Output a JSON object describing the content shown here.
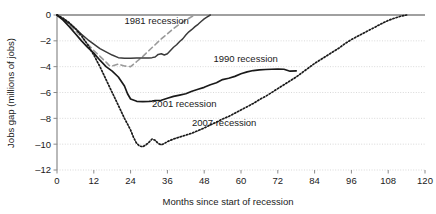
{
  "chart_data": {
    "type": "line",
    "title": "",
    "xlabel": "Months since start of recession",
    "ylabel": "Jobs gap (millions of jobs)",
    "xlim": [
      0,
      120
    ],
    "ylim": [
      -12,
      0
    ],
    "xticks": [
      0,
      12,
      24,
      36,
      48,
      60,
      72,
      84,
      96,
      108,
      120
    ],
    "xtick_labels": [
      "0",
      "12",
      "24",
      "36",
      "48",
      "60",
      "72",
      "84",
      "96",
      "108",
      "120"
    ],
    "yticks": [
      0,
      -2,
      -4,
      -6,
      -8,
      -10,
      -12
    ],
    "ytick_labels": [
      "0",
      "–2",
      "–4",
      "–6",
      "–8",
      "–10",
      "–12"
    ],
    "grid": true,
    "grid_axis": "y",
    "legend_position": "inline-annotations",
    "series": [
      {
        "name": "1981 recession",
        "label": "1981 recession",
        "color": "#9a9a9a",
        "style": "dashed",
        "width": 1.6,
        "label_x": 22,
        "label_y": -0.72,
        "x": [
          0,
          2,
          4,
          6,
          8,
          10,
          12,
          14,
          16,
          17,
          18,
          20,
          22,
          24,
          26,
          28,
          30,
          32,
          34,
          36,
          38,
          40,
          42,
          44,
          45
        ],
        "y": [
          0,
          -0.35,
          -0.75,
          -1.2,
          -1.7,
          -2.25,
          -2.75,
          -3.2,
          -3.65,
          -3.9,
          -3.95,
          -3.8,
          -3.95,
          -4.0,
          -3.6,
          -3.2,
          -2.75,
          -2.3,
          -1.85,
          -1.45,
          -1.05,
          -0.7,
          -0.4,
          -0.12,
          0
        ]
      },
      {
        "name": "1990 recession",
        "label": "1990 recession",
        "color": "#3a3a3a",
        "style": "solid",
        "width": 1.5,
        "label_x": 51,
        "label_y": -3.62,
        "x": [
          0,
          2,
          4,
          6,
          8,
          10,
          12,
          14,
          16,
          18,
          20,
          22,
          24,
          26,
          28,
          30,
          31,
          32,
          33,
          34,
          35,
          36,
          37,
          38,
          39,
          40,
          41,
          42,
          43,
          44,
          45,
          46,
          47,
          48,
          49,
          50
        ],
        "y": [
          0,
          -0.3,
          -0.65,
          -1.05,
          -1.5,
          -1.9,
          -2.25,
          -2.6,
          -2.85,
          -3.1,
          -3.3,
          -3.35,
          -3.34,
          -3.33,
          -3.33,
          -3.32,
          -3.3,
          -3.25,
          -3.05,
          -3.0,
          -3.1,
          -3.0,
          -2.75,
          -2.5,
          -2.3,
          -2.05,
          -1.85,
          -1.55,
          -1.3,
          -1.12,
          -0.9,
          -0.72,
          -0.5,
          -0.3,
          -0.15,
          0
        ]
      },
      {
        "name": "2001 recession",
        "label": "2001 recession",
        "color": "#1a1a1a",
        "style": "solid",
        "width": 1.7,
        "label_x": 31,
        "label_y": -7.1,
        "x": [
          0,
          2,
          4,
          6,
          8,
          10,
          12,
          14,
          16,
          18,
          20,
          22,
          23,
          24,
          26,
          28,
          30,
          31,
          32,
          34,
          36,
          38,
          40,
          42,
          44,
          46,
          48,
          50,
          52,
          54,
          56,
          58,
          60,
          62,
          64,
          66,
          68,
          70,
          72,
          74,
          76,
          78
        ],
        "y": [
          0,
          -0.4,
          -0.9,
          -1.45,
          -2.0,
          -2.5,
          -2.95,
          -3.5,
          -4.0,
          -4.35,
          -4.8,
          -5.5,
          -6.1,
          -6.5,
          -6.68,
          -6.7,
          -6.68,
          -6.66,
          -6.62,
          -6.6,
          -6.45,
          -6.3,
          -6.2,
          -6.1,
          -5.9,
          -5.75,
          -5.6,
          -5.4,
          -5.25,
          -5.0,
          -4.9,
          -4.75,
          -4.55,
          -4.4,
          -4.3,
          -4.25,
          -4.22,
          -4.2,
          -4.18,
          -4.2,
          -4.35,
          -4.32
        ]
      },
      {
        "name": "2007 recession",
        "label": "2007 recession",
        "color": "#1a1a1a",
        "style": "dotted",
        "width": 1.7,
        "label_x": 44,
        "label_y": -8.6,
        "x": [
          0,
          2,
          4,
          6,
          8,
          10,
          12,
          14,
          16,
          18,
          20,
          22,
          24,
          25,
          26,
          27,
          28,
          29,
          30,
          31,
          32,
          33,
          34,
          35,
          36,
          38,
          40,
          42,
          44,
          46,
          48,
          50,
          52,
          54,
          56,
          58,
          60,
          62,
          64,
          66,
          68,
          70,
          72,
          74,
          76,
          78,
          80,
          82,
          84,
          86,
          88,
          90,
          92,
          94,
          96,
          98,
          100,
          102,
          104,
          106,
          108,
          110,
          112,
          114
        ],
        "y": [
          0,
          -0.25,
          -0.6,
          -1.05,
          -1.6,
          -2.3,
          -3.1,
          -4.0,
          -5.0,
          -6.0,
          -7.0,
          -8.0,
          -8.9,
          -9.5,
          -9.95,
          -10.15,
          -10.2,
          -10.05,
          -9.85,
          -9.6,
          -9.7,
          -9.95,
          -10.05,
          -9.95,
          -9.8,
          -9.6,
          -9.45,
          -9.3,
          -9.15,
          -8.95,
          -8.75,
          -8.5,
          -8.3,
          -8.05,
          -7.85,
          -7.6,
          -7.35,
          -7.1,
          -6.85,
          -6.55,
          -6.3,
          -6.0,
          -5.7,
          -5.4,
          -5.1,
          -4.8,
          -4.45,
          -4.1,
          -3.75,
          -3.45,
          -3.15,
          -2.85,
          -2.55,
          -2.2,
          -1.9,
          -1.65,
          -1.4,
          -1.15,
          -0.9,
          -0.65,
          -0.42,
          -0.25,
          -0.1,
          0
        ]
      }
    ]
  },
  "colors": {
    "background": "#ffffff",
    "text": "#1a1a1a",
    "grid": "#c9c9c9",
    "axis": "#8a8a8a"
  }
}
